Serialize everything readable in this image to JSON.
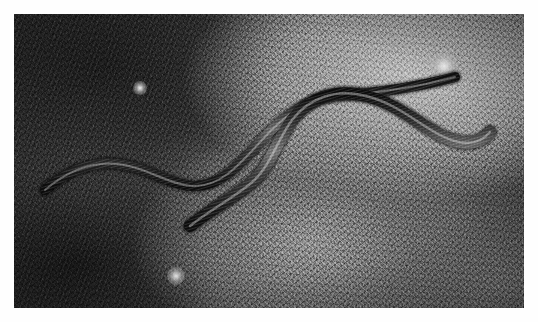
{
  "image": {
    "title": "Two slow worms on grass",
    "subject": "two slow worms (legless lizards) lying on grassy ground",
    "medium": "black and white photograph",
    "orientation": "landscape",
    "border": {
      "present": true,
      "color": "#fefefe",
      "width_px": 14
    },
    "canvas": {
      "width_px": 510,
      "height_px": 294
    },
    "palette": {
      "border": "#fefefe",
      "darkest_ground": "#141414",
      "dark_ground": "#2b2b2b",
      "mid_ground": "#6b6b6b",
      "light_ground": "#b4b4b4",
      "brightest_grass": "#f2f2f2",
      "animal_body_dark": "#171717",
      "animal_body_mid": "#3b3b3b",
      "animal_highlight": "#8e8e8e"
    },
    "tonal_regions": [
      {
        "name": "upper-left-corner",
        "tone": "very dark",
        "hex": "#1d1d1d"
      },
      {
        "name": "upper-right-quadrant",
        "tone": "bright",
        "hex": "#b2b2b2"
      },
      {
        "name": "lower-left-quadrant",
        "tone": "dark",
        "hex": "#242424"
      },
      {
        "name": "lower-center",
        "tone": "mid",
        "hex": "#6f6f6f"
      },
      {
        "name": "lower-right-corner",
        "tone": "mid-light",
        "hex": "#8a8a8a"
      }
    ],
    "highlights": [
      {
        "name": "bright-spot-upper-left",
        "x": 126,
        "y": 74,
        "r": 7
      },
      {
        "name": "bright-cluster-lower-center",
        "x": 162,
        "y": 262,
        "r": 9
      },
      {
        "name": "bright-patch-right",
        "x": 430,
        "y": 52,
        "r": 14
      }
    ],
    "animals": [
      {
        "name": "slow-worm-upper",
        "description": "long sinuous body entering from mid-left, undulating right, thin tapering tail exits toward upper right",
        "path": "M 31 176 C 52 158, 76 147, 104 150 C 133 153, 152 170, 178 172 C 206 174, 226 150, 248 126 C 271 100, 296 84, 322 82 C 352 80, 382 76, 412 70 C 425 67, 434 65, 441 63",
        "thickness_start": 9,
        "thickness_end": 2
      },
      {
        "name": "slow-worm-lower",
        "description": "second body, thicker, tail at lower center-left, curves up over the first, then sweeps right and down, head near right edge",
        "path": "M 176 212 C 196 196, 216 186, 236 170 C 256 154, 262 128, 278 106 C 295 84, 322 74, 352 82 C 384 90, 404 110, 428 122 C 450 133, 466 130, 476 118",
        "thickness_start": 7,
        "thickness_end": 11
      }
    ]
  }
}
